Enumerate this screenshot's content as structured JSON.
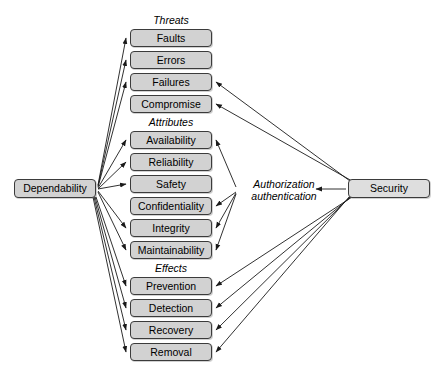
{
  "diagram": {
    "background_color": "#ffffff",
    "node_fill": "#d2d2d2",
    "node_border": "#3b3b3b",
    "edge_color": "#1a1a1a"
  },
  "root": {
    "label": "Dependability",
    "x": 14,
    "y": 179,
    "w": 82,
    "h": 19
  },
  "security": {
    "label": "Security",
    "x": 348,
    "y": 179,
    "w": 82,
    "h": 19
  },
  "hub": {
    "line1": "Authorization",
    "line2": "authentication",
    "x": 238,
    "y": 178,
    "w": 92,
    "h": 26
  },
  "groups": [
    {
      "label": "Threats",
      "label_x": 130,
      "label_y": 14,
      "label_w": 82,
      "nodes": [
        {
          "label": "Faults",
          "x": 130,
          "y": 29,
          "w": 82,
          "h": 18
        },
        {
          "label": "Errors",
          "x": 130,
          "y": 51,
          "w": 82,
          "h": 18
        },
        {
          "label": "Failures",
          "x": 130,
          "y": 73,
          "w": 82,
          "h": 18
        },
        {
          "label": "Compromise",
          "x": 130,
          "y": 95,
          "w": 82,
          "h": 18
        }
      ]
    },
    {
      "label": "Attributes",
      "label_x": 130,
      "label_y": 116,
      "label_w": 82,
      "nodes": [
        {
          "label": "Availability",
          "x": 130,
          "y": 131,
          "w": 82,
          "h": 18
        },
        {
          "label": "Reliability",
          "x": 130,
          "y": 153,
          "w": 82,
          "h": 18
        },
        {
          "label": "Safety",
          "x": 130,
          "y": 175,
          "w": 82,
          "h": 18
        },
        {
          "label": "Confidentiality",
          "x": 130,
          "y": 197,
          "w": 82,
          "h": 18
        },
        {
          "label": "Integrity",
          "x": 130,
          "y": 219,
          "w": 82,
          "h": 18
        },
        {
          "label": "Maintainability",
          "x": 130,
          "y": 241,
          "w": 82,
          "h": 18
        }
      ]
    },
    {
      "label": "Effects",
      "label_x": 130,
      "label_y": 262,
      "label_w": 82,
      "nodes": [
        {
          "label": "Prevention",
          "x": 130,
          "y": 277,
          "w": 82,
          "h": 18
        },
        {
          "label": "Detection",
          "x": 130,
          "y": 299,
          "w": 82,
          "h": 18
        },
        {
          "label": "Recovery",
          "x": 130,
          "y": 321,
          "w": 82,
          "h": 18
        },
        {
          "label": "Removal",
          "x": 130,
          "y": 343,
          "w": 82,
          "h": 18
        }
      ]
    }
  ],
  "edges": [
    {
      "from": "Dependability",
      "to": "Faults",
      "x1": 98,
      "y1": 185,
      "x2": 126,
      "y2": 38
    },
    {
      "from": "Dependability",
      "to": "Errors",
      "x1": 98,
      "y1": 186,
      "x2": 126,
      "y2": 60
    },
    {
      "from": "Dependability",
      "to": "Failures",
      "x1": 98,
      "y1": 187,
      "x2": 126,
      "y2": 82
    },
    {
      "from": "Dependability",
      "to": "Availability",
      "x1": 98,
      "y1": 188,
      "x2": 126,
      "y2": 140
    },
    {
      "from": "Dependability",
      "to": "Reliability",
      "x1": 98,
      "y1": 189,
      "x2": 126,
      "y2": 162
    },
    {
      "from": "Dependability",
      "to": "Safety",
      "x1": 98,
      "y1": 189,
      "x2": 126,
      "y2": 184
    },
    {
      "from": "Dependability",
      "to": "Integrity",
      "x1": 98,
      "y1": 191,
      "x2": 126,
      "y2": 228
    },
    {
      "from": "Dependability",
      "to": "Maintainability",
      "x1": 98,
      "y1": 192,
      "x2": 126,
      "y2": 250
    },
    {
      "from": "Dependability",
      "to": "Prevention",
      "x1": 96,
      "y1": 197,
      "x2": 126,
      "y2": 286
    },
    {
      "from": "Dependability",
      "to": "Detection",
      "x1": 95,
      "y1": 197,
      "x2": 126,
      "y2": 308
    },
    {
      "from": "Dependability",
      "to": "Recovery",
      "x1": 94,
      "y1": 197,
      "x2": 126,
      "y2": 330
    },
    {
      "from": "Dependability",
      "to": "Removal",
      "x1": 93,
      "y1": 197,
      "x2": 126,
      "y2": 352
    },
    {
      "from": "Security",
      "to": "Failures",
      "x1": 350,
      "y1": 181,
      "x2": 216,
      "y2": 82
    },
    {
      "from": "Security",
      "to": "Compromise",
      "x1": 352,
      "y1": 181,
      "x2": 216,
      "y2": 104
    },
    {
      "from": "Security",
      "to": "Prevention",
      "x1": 352,
      "y1": 197,
      "x2": 216,
      "y2": 286
    },
    {
      "from": "Security",
      "to": "Detection",
      "x1": 351,
      "y1": 197,
      "x2": 216,
      "y2": 308
    },
    {
      "from": "Security",
      "to": "Recovery",
      "x1": 350,
      "y1": 197,
      "x2": 216,
      "y2": 330
    },
    {
      "from": "Security",
      "to": "Removal",
      "x1": 349,
      "y1": 197,
      "x2": 216,
      "y2": 352
    },
    {
      "from": "Security",
      "to": "Authorization authentication",
      "x1": 346,
      "y1": 189,
      "x2": 316,
      "y2": 189
    },
    {
      "from": "Authorization authentication",
      "to": "Availability",
      "x1": 236,
      "y1": 187,
      "x2": 216,
      "y2": 140
    },
    {
      "from": "Authorization authentication",
      "to": "Confidentiality",
      "x1": 236,
      "y1": 192,
      "x2": 216,
      "y2": 206
    },
    {
      "from": "Authorization authentication",
      "to": "Integrity",
      "x1": 236,
      "y1": 193,
      "x2": 216,
      "y2": 228
    },
    {
      "from": "Authorization authentication",
      "to": "Maintainability",
      "x1": 236,
      "y1": 194,
      "x2": 216,
      "y2": 250
    }
  ]
}
